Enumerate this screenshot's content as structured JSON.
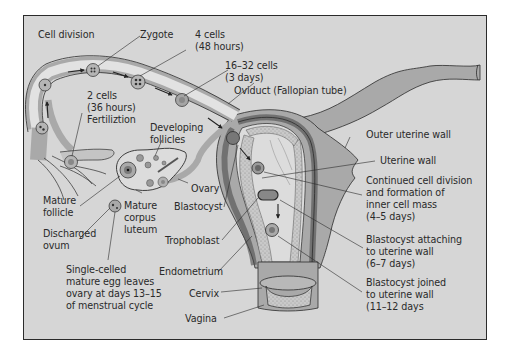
{
  "figure": {
    "colors": {
      "background": "#d6d6d6",
      "tube_fill": "#a9a9a9",
      "tube_lumen": "#e2e2e2",
      "outline": "#2b2b2b",
      "endometrium": "#c4c4c4",
      "text": "#2a2a2a"
    }
  },
  "labels": {
    "cell_division": "Cell division",
    "zygote": "Zygote",
    "four_cells": "4 cells\n(48 hours)",
    "sixteen_cells": "16–32 cells\n(3 days)",
    "oviduct": "Oviduct (Fallopian tube)",
    "two_cells": "2 cells\n(36 hours)\nFertiliztion",
    "developing_follicles": "Developing\nfollicles",
    "outer_uterine_wall": "Outer uterine wall",
    "uterine_wall": "Uterine wall",
    "mature_follicle": "Mature\nfollicle",
    "ovary": "Ovary",
    "blastocyst": "Blastocyst",
    "mature_corpus_luteum": "Mature\ncorpus\nluteum",
    "continued_division": "Continued cell division\nand formation of\ninner cell mass\n(4–5 days)",
    "discharged_ovum": "Discharged\novum",
    "trophoblast": "Trophoblast",
    "attaching": "Blastocyst attaching\nto uterine wall\n(6–7 days)",
    "single_celled": "Single-celled\nmature egg leaves\novary at days 13–15\nof menstrual cycle",
    "endometrium": "Endometrium",
    "joined": "Blastocyst joined\nto uterine wall\n(11–12 days",
    "cervix": "Cervix",
    "vagina": "Vagina"
  }
}
